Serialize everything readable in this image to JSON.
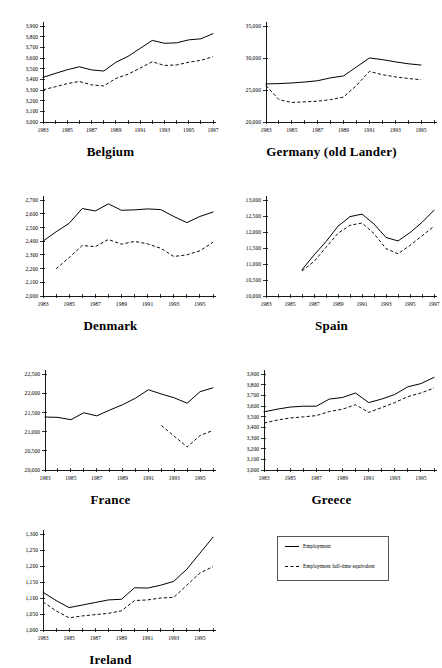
{
  "figure": {
    "legend": {
      "entries": [
        {
          "label": "Employment",
          "style": "solid"
        },
        {
          "label": "Employment full-time equivalent",
          "style": "dashed"
        }
      ]
    }
  },
  "chart_data": [
    {
      "id": "belgium",
      "type": "line",
      "title": "Belgium",
      "xlabel": "",
      "ylabel": "",
      "xlim": [
        1983,
        1997
      ],
      "ylim": [
        3000,
        3900
      ],
      "ytick_step": 100,
      "yticks": [
        3000,
        3100,
        3200,
        3300,
        3400,
        3500,
        3600,
        3700,
        3800,
        3900
      ],
      "ytick_labels": [
        "3,000",
        "3,100",
        "3,200",
        "3,300",
        "3,400",
        "3,500",
        "3,600",
        "3,700",
        "3,800",
        "3,900"
      ],
      "xticks": [
        1983,
        1984,
        1985,
        1986,
        1987,
        1988,
        1989,
        1990,
        1991,
        1992,
        1993,
        1994,
        1995,
        1996,
        1997
      ],
      "xtick_labels": [
        "1983",
        "",
        "1985",
        "",
        "1987",
        "",
        "1989",
        "",
        "1991",
        "",
        "1993",
        "",
        "1995",
        "",
        "1997"
      ],
      "grid": false,
      "series": [
        {
          "name": "Employment",
          "style": "solid",
          "x": [
            1983,
            1984,
            1985,
            1986,
            1987,
            1988,
            1989,
            1990,
            1991,
            1992,
            1993,
            1994,
            1995,
            1996,
            1997
          ],
          "values": [
            3418,
            3455,
            3490,
            3518,
            3488,
            3478,
            3560,
            3615,
            3690,
            3765,
            3738,
            3742,
            3770,
            3780,
            3828
          ]
        },
        {
          "name": "Employment full-time equivalent",
          "style": "dashed",
          "x": [
            1983,
            1984,
            1985,
            1986,
            1987,
            1988,
            1989,
            1990,
            1991,
            1992,
            1993,
            1994,
            1995,
            1996,
            1997
          ],
          "values": [
            3302,
            3330,
            3360,
            3380,
            3348,
            3338,
            3408,
            3448,
            3505,
            3565,
            3530,
            3535,
            3560,
            3578,
            3612
          ]
        }
      ]
    },
    {
      "id": "germany",
      "type": "line",
      "title": "Germany (old Lander)",
      "xlabel": "",
      "ylabel": "",
      "xlim": [
        1983,
        1996
      ],
      "ylim": [
        20000,
        35000
      ],
      "ytick_step": 5000,
      "yticks": [
        20000,
        25000,
        30000,
        35000
      ],
      "ytick_labels": [
        "20,000",
        "25,000",
        "30,000",
        "35,000"
      ],
      "xticks": [
        1983,
        1984,
        1985,
        1986,
        1987,
        1988,
        1989,
        1990,
        1991,
        1992,
        1993,
        1994,
        1995,
        1996
      ],
      "xtick_labels": [
        "1983",
        "",
        "1985",
        "",
        "1987",
        "",
        "1989",
        "",
        "1991",
        "",
        "1993",
        "",
        "1995",
        ""
      ],
      "grid": false,
      "series": [
        {
          "name": "Employment",
          "style": "solid",
          "x": [
            1983,
            1984,
            1985,
            1986,
            1987,
            1988,
            1989,
            1990,
            1991,
            1992,
            1993,
            1994,
            1995
          ],
          "values": [
            25950,
            26000,
            26100,
            26250,
            26450,
            26900,
            27200,
            28600,
            30000,
            29750,
            29400,
            29100,
            28900
          ]
        },
        {
          "name": "Employment full-time equivalent",
          "style": "dashed",
          "x": [
            1983,
            1984,
            1985,
            1986,
            1987,
            1988,
            1989,
            1990,
            1991,
            1992,
            1993,
            1994,
            1995
          ],
          "values": [
            25700,
            23500,
            23050,
            23150,
            23250,
            23500,
            23900,
            25700,
            27900,
            27400,
            27050,
            26800,
            26600
          ]
        }
      ]
    },
    {
      "id": "denmark",
      "type": "line",
      "title": "Denmark",
      "xlabel": "",
      "ylabel": "",
      "xlim": [
        1983,
        1996
      ],
      "ylim": [
        2000,
        2700
      ],
      "ytick_step": 100,
      "yticks": [
        2000,
        2100,
        2200,
        2300,
        2400,
        2500,
        2600,
        2700
      ],
      "ytick_labels": [
        "2,000",
        "2,100",
        "2,200",
        "2,300",
        "2,400",
        "2,500",
        "2,600",
        "2,700"
      ],
      "xticks": [
        1983,
        1984,
        1985,
        1986,
        1987,
        1988,
        1989,
        1990,
        1991,
        1992,
        1993,
        1994,
        1995,
        1996
      ],
      "xtick_labels": [
        "1983",
        "",
        "1985",
        "",
        "1987",
        "",
        "1989",
        "",
        "1991",
        "",
        "1993",
        "",
        "1995",
        ""
      ],
      "grid": false,
      "series": [
        {
          "name": "Employment",
          "style": "solid",
          "x": [
            1983,
            1984,
            1985,
            1986,
            1987,
            1988,
            1989,
            1990,
            1991,
            1992,
            1993,
            1994,
            1995,
            1996
          ],
          "values": [
            2400,
            2468,
            2530,
            2638,
            2620,
            2672,
            2625,
            2628,
            2635,
            2630,
            2580,
            2535,
            2580,
            2612
          ]
        },
        {
          "name": "Employment full-time equivalent",
          "style": "dashed",
          "x": [
            1984,
            1985,
            1986,
            1987,
            1988,
            1989,
            1990,
            1991,
            1992,
            1993,
            1994,
            1995,
            1996
          ],
          "values": [
            2198,
            2280,
            2368,
            2360,
            2412,
            2378,
            2398,
            2380,
            2348,
            2288,
            2300,
            2330,
            2392
          ]
        }
      ]
    },
    {
      "id": "spain",
      "type": "line",
      "title": "Spain",
      "xlabel": "",
      "ylabel": "",
      "xlim": [
        1983,
        1997
      ],
      "ylim": [
        10000,
        13000
      ],
      "ytick_step": 500,
      "yticks": [
        10000,
        10500,
        11000,
        11500,
        12000,
        12500,
        13000
      ],
      "ytick_labels": [
        "10,000",
        "10,500",
        "11,000",
        "11,500",
        "12,000",
        "12,500",
        "13,000"
      ],
      "xticks": [
        1983,
        1984,
        1985,
        1986,
        1987,
        1988,
        1989,
        1990,
        1991,
        1992,
        1993,
        1994,
        1995,
        1996,
        1997
      ],
      "xtick_labels": [
        "1983",
        "",
        "1985",
        "",
        "1987",
        "",
        "1989",
        "",
        "1991",
        "",
        "1993",
        "",
        "1995",
        "",
        "1997"
      ],
      "grid": false,
      "series": [
        {
          "name": "Employment",
          "style": "solid",
          "x": [
            1986,
            1987,
            1988,
            1989,
            1990,
            1991,
            1992,
            1993,
            1994,
            1995,
            1996,
            1997
          ],
          "values": [
            10820,
            11280,
            11700,
            12180,
            12480,
            12560,
            12250,
            11830,
            11720,
            11980,
            12300,
            12680
          ]
        },
        {
          "name": "Employment full-time equivalent",
          "style": "dashed",
          "x": [
            1986,
            1987,
            1988,
            1989,
            1990,
            1991,
            1992,
            1993,
            1994,
            1995,
            1996,
            1997
          ],
          "values": [
            10780,
            11080,
            11520,
            11960,
            12210,
            12280,
            11950,
            11480,
            11320,
            11580,
            11880,
            12180
          ]
        }
      ]
    },
    {
      "id": "france",
      "type": "line",
      "title": "France",
      "xlabel": "",
      "ylabel": "",
      "xlim": [
        1983,
        1996
      ],
      "ylim": [
        20000,
        22500
      ],
      "ytick_step": 500,
      "yticks": [
        20000,
        20500,
        21000,
        21500,
        22000,
        22500
      ],
      "ytick_labels": [
        "20,000",
        "20,500",
        "21,000",
        "21,500",
        "22,000",
        "22,500"
      ],
      "xticks": [
        1983,
        1984,
        1985,
        1986,
        1987,
        1988,
        1989,
        1990,
        1991,
        1992,
        1993,
        1994,
        1995,
        1996
      ],
      "xtick_labels": [
        "1983",
        "",
        "1985",
        "",
        "1987",
        "",
        "1989",
        "",
        "1991",
        "",
        "1993",
        "",
        "1995",
        ""
      ],
      "grid": false,
      "series": [
        {
          "name": "Employment",
          "style": "solid",
          "x": [
            1983,
            1984,
            1985,
            1986,
            1987,
            1988,
            1989,
            1990,
            1991,
            1992,
            1993,
            1994,
            1995,
            1996
          ],
          "values": [
            21380,
            21370,
            21310,
            21490,
            21410,
            21560,
            21700,
            21870,
            22090,
            21980,
            21880,
            21740,
            22040,
            22140
          ]
        },
        {
          "name": "Employment full-time equivalent",
          "style": "dashed",
          "x": [
            1992,
            1993,
            1994,
            1995,
            1996
          ],
          "values": [
            21160,
            20880,
            20600,
            20900,
            21030
          ]
        }
      ]
    },
    {
      "id": "greece",
      "type": "line",
      "title": "Greece",
      "xlabel": "",
      "ylabel": "",
      "xlim": [
        1983,
        1996
      ],
      "ylim": [
        3000,
        3900
      ],
      "ytick_step": 100,
      "yticks": [
        3000,
        3100,
        3200,
        3300,
        3400,
        3500,
        3600,
        3700,
        3800,
        3900
      ],
      "ytick_labels": [
        "3,000",
        "3,100",
        "3,200",
        "3,300",
        "3,400",
        "3,500",
        "3,600",
        "3,700",
        "3,800",
        "3,900"
      ],
      "xticks": [
        1983,
        1984,
        1985,
        1986,
        1987,
        1988,
        1989,
        1990,
        1991,
        1992,
        1993,
        1994,
        1995,
        1996
      ],
      "xtick_labels": [
        "1983",
        "",
        "1985",
        "",
        "1987",
        "",
        "1989",
        "",
        "1991",
        "",
        "1993",
        "",
        "1995",
        ""
      ],
      "grid": false,
      "series": [
        {
          "name": "Employment",
          "style": "solid",
          "x": [
            1983,
            1984,
            1985,
            1986,
            1987,
            1988,
            1989,
            1990,
            1991,
            1992,
            1993,
            1994,
            1995,
            1996
          ],
          "values": [
            3545,
            3570,
            3590,
            3598,
            3598,
            3665,
            3680,
            3722,
            3632,
            3665,
            3708,
            3780,
            3810,
            3868
          ]
        },
        {
          "name": "Employment full-time equivalent",
          "style": "dashed",
          "x": [
            1983,
            1984,
            1985,
            1986,
            1987,
            1988,
            1989,
            1990,
            1991,
            1992,
            1993,
            1994,
            1995,
            1996
          ],
          "values": [
            3440,
            3468,
            3488,
            3498,
            3510,
            3548,
            3570,
            3612,
            3540,
            3585,
            3632,
            3688,
            3722,
            3768
          ]
        }
      ]
    },
    {
      "id": "ireland",
      "type": "line",
      "title": "Ireland",
      "xlabel": "",
      "ylabel": "",
      "xlim": [
        1983,
        1996
      ],
      "ylim": [
        1000,
        1300
      ],
      "ytick_step": 50,
      "yticks": [
        1000,
        1050,
        1100,
        1150,
        1200,
        1250,
        1300
      ],
      "ytick_labels": [
        "1,000",
        "1,050",
        "1,100",
        "1,150",
        "1,200",
        "1,250",
        "1,300"
      ],
      "xticks": [
        1983,
        1984,
        1985,
        1986,
        1987,
        1988,
        1989,
        1990,
        1991,
        1992,
        1993,
        1994,
        1995,
        1996
      ],
      "xtick_labels": [
        "1983",
        "",
        "1985",
        "",
        "1987",
        "",
        "1989",
        "",
        "1991",
        "",
        "1993",
        "",
        "1995",
        ""
      ],
      "grid": false,
      "series": [
        {
          "name": "Employment",
          "style": "solid",
          "x": [
            1983,
            1984,
            1985,
            1986,
            1987,
            1988,
            1989,
            1990,
            1991,
            1992,
            1993,
            1994,
            1995,
            1996
          ],
          "values": [
            1118,
            1092,
            1070,
            1078,
            1086,
            1094,
            1096,
            1132,
            1131,
            1140,
            1152,
            1190,
            1240,
            1290
          ]
        },
        {
          "name": "Employment full-time equivalent",
          "style": "dashed",
          "x": [
            1983,
            1984,
            1985,
            1986,
            1987,
            1988,
            1989,
            1990,
            1991,
            1992,
            1993,
            1994,
            1995,
            1996
          ],
          "values": [
            1088,
            1060,
            1038,
            1044,
            1048,
            1052,
            1060,
            1092,
            1094,
            1100,
            1102,
            1140,
            1178,
            1198
          ]
        }
      ]
    }
  ]
}
